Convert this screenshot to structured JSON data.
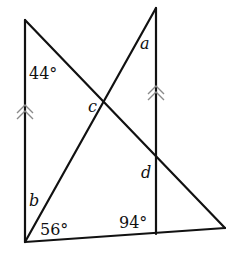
{
  "diagram": {
    "type": "geometry",
    "parallel_marker": "double-chevron-arrow",
    "colors": {
      "line": "#111111",
      "marker": "#8a8a8a"
    },
    "labels": {
      "angle_top_left": "44°",
      "angle_bottom_left_56": "56°",
      "angle_bottom_right_94": "94°",
      "var_a": "a",
      "var_b": "b",
      "var_c": "c",
      "var_d": "d"
    }
  }
}
